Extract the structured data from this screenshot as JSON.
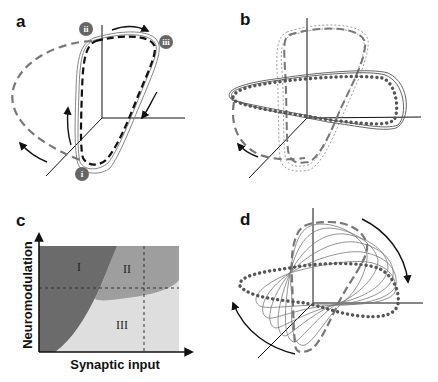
{
  "figure": {
    "panels": [
      {
        "id": "a",
        "label": "a",
        "markers": [
          "i",
          "ii",
          "iii"
        ]
      },
      {
        "id": "b",
        "label": "b"
      },
      {
        "id": "c",
        "label": "c",
        "xlabel": "Synaptic input",
        "ylabel": "Neuromodulation",
        "regions": [
          "I",
          "II",
          "III"
        ]
      },
      {
        "id": "d",
        "label": "d"
      }
    ],
    "colors": {
      "region_I": "#6b6b6b",
      "region_II": "#9e9e9e",
      "region_III": "#dedede",
      "dashed_trajectory": "#777777",
      "dotted_trajectory": "#555555",
      "axis": "#111111"
    }
  }
}
